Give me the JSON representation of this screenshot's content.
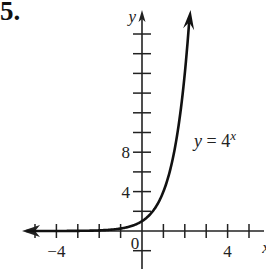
{
  "problem": {
    "number": "5."
  },
  "chart_data": {
    "type": "line",
    "title": "",
    "function": "y = 4^x",
    "annotation": {
      "text_main": "y = 4",
      "text_sup": "x"
    },
    "xlabel": "x",
    "ylabel": "y",
    "xlim": [
      -5.5,
      5.5
    ],
    "ylim": [
      -1.8,
      22
    ],
    "x_ticks": [
      -5,
      -4,
      -3,
      -2,
      -1,
      1,
      2,
      3,
      4,
      5
    ],
    "x_tick_labels": [
      {
        "value": -4,
        "label": "−4"
      },
      {
        "value": 0,
        "label": "0"
      },
      {
        "value": 4,
        "label": "4"
      }
    ],
    "y_ticks": [
      -2,
      2,
      4,
      6,
      8,
      10,
      12,
      14,
      16,
      18,
      20
    ],
    "y_tick_labels": [
      {
        "value": 4,
        "label": "4"
      },
      {
        "value": 8,
        "label": "8"
      }
    ],
    "grid": false,
    "series": [
      {
        "name": "y = 4^x",
        "x": [
          -5.5,
          -3,
          -2,
          -1,
          -0.5,
          0,
          0.5,
          1,
          1.5,
          2,
          2.23
        ],
        "y": [
          0.0005,
          0.0156,
          0.0625,
          0.25,
          0.5,
          1,
          2,
          4,
          8,
          16,
          22
        ]
      }
    ]
  }
}
